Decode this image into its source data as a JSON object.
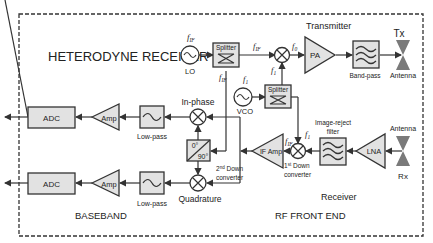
{
  "sections": {
    "baseband": "BASEBAND",
    "rf_front_end": "RF FRONT END",
    "transmitter": "Transmitter",
    "receiver": "Receiver"
  },
  "blocks": {
    "adc_top": "ADC",
    "adc_bottom": "ADC",
    "amp_top": "Amp",
    "amp_bottom": "Amp",
    "lowpass_top": "Low-pass",
    "lowpass_bottom": "Low-pass",
    "inphase": "In-phase",
    "quadrature": "Quadrature",
    "phase_0": "0°",
    "phase_90": "90°",
    "second_down_1": "2nd Down",
    "second_down_2": "converter",
    "first_down_1": "1st Down",
    "first_down_2": "converter",
    "if_amp": "IF Amp",
    "image_reject_1": "Image-reject",
    "image_reject_2": "filter",
    "lna": "LNA",
    "antenna_rx": "Antenna",
    "rx": "Rx",
    "lo": "LO",
    "vco": "VCO",
    "splitter_top": "Splitter",
    "splitter_bottom": "Splitter",
    "pa": "PA",
    "bandpass": "Band-pass",
    "antenna_tx": "Antenna",
    "tx": "Tx"
  },
  "signals": {
    "f_if_lo": "fIF",
    "f_if_split_right": "fIF",
    "f_if_split_down": "fIF",
    "f0": "f0",
    "f1_mixer": "f1",
    "f1_vco": "f1",
    "f1_rx_mixer": "f1",
    "f0_rx": "f0",
    "f_if_rx": "fIF"
  },
  "colors": {
    "block_fill": "#e2e2e2",
    "stroke": "#333333",
    "antenna": "#7a7a7a"
  }
}
